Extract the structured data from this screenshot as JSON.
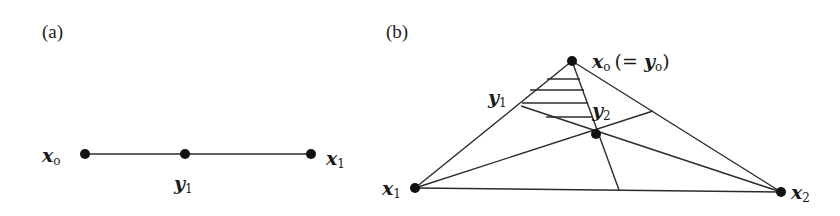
{
  "panels": [
    {
      "id": "a",
      "label": "(a)",
      "points": [
        {
          "name": "x_o",
          "base": "x",
          "sub": "o",
          "x": 85,
          "y": 154
        },
        {
          "name": "y_1",
          "base": "y",
          "sub": "1",
          "x": 185,
          "y": 154
        },
        {
          "name": "x_1",
          "base": "x",
          "sub": "1",
          "x": 311,
          "y": 154
        }
      ]
    },
    {
      "id": "b",
      "label": "(b)",
      "vertices": [
        {
          "name": "x_o",
          "base": "x",
          "sub": "o",
          "extra": "(= ",
          "extra_base": "y",
          "extra_sub": "o",
          "extra_close": ")"
        },
        {
          "name": "x_1",
          "base": "x",
          "sub": "1"
        },
        {
          "name": "x_2",
          "base": "x",
          "sub": "2"
        }
      ],
      "interior_labels": [
        {
          "name": "y_1",
          "base": "y",
          "sub": "1"
        },
        {
          "name": "y_2",
          "base": "y",
          "sub": "2"
        }
      ],
      "hatch_lines": 4
    }
  ]
}
